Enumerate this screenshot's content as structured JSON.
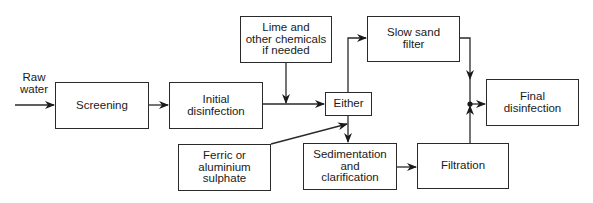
{
  "diagram": {
    "type": "flowchart",
    "title": "",
    "input_label": "Raw\nwater",
    "nodes": [
      {
        "id": "screening",
        "label": "Screening"
      },
      {
        "id": "initial_disinfection",
        "label": "Initial\ndisinfection"
      },
      {
        "id": "lime",
        "label": "Lime and\nother chemicals\nif needed"
      },
      {
        "id": "either",
        "label": "Either"
      },
      {
        "id": "slow_sand_filter",
        "label": "Slow sand\nfilter"
      },
      {
        "id": "ferric",
        "label": "Ferric or\naluminium\nsulphate"
      },
      {
        "id": "sedimentation",
        "label": "Sedimentation\nand\nclarification"
      },
      {
        "id": "filtration",
        "label": "Filtration"
      },
      {
        "id": "final_disinfection",
        "label": "Final\ndisinfection"
      }
    ],
    "edges": [
      {
        "from": "raw_water",
        "to": "screening"
      },
      {
        "from": "screening",
        "to": "initial_disinfection"
      },
      {
        "from": "initial_disinfection",
        "to": "either"
      },
      {
        "from": "lime",
        "to": "initial_disinfection->either"
      },
      {
        "from": "either",
        "to": "slow_sand_filter"
      },
      {
        "from": "either",
        "to": "sedimentation"
      },
      {
        "from": "ferric",
        "to": "either->sedimentation"
      },
      {
        "from": "sedimentation",
        "to": "filtration"
      },
      {
        "from": "slow_sand_filter",
        "to": "final_disinfection"
      },
      {
        "from": "filtration",
        "to": "final_disinfection"
      }
    ]
  }
}
